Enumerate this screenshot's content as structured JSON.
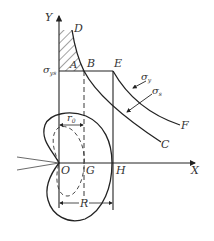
{
  "diagram": {
    "type": "stress-distribution-plastic-zone",
    "axes": {
      "x_label": "X",
      "y_label": "Y",
      "origin_label": "O"
    },
    "points": {
      "D": "D",
      "A": "A",
      "B": "B",
      "E": "E",
      "F": "F",
      "C": "C",
      "G": "G",
      "H": "H"
    },
    "stress_labels": {
      "yield_main": "σ",
      "yield_sub": "ys",
      "sigma_y_main": "σ",
      "sigma_y_sub": "y",
      "sigma_s_main": "σ",
      "sigma_s_sub": "s"
    },
    "dimensions": {
      "r0_main": "r",
      "r0_sub": "0",
      "R": "R"
    },
    "colors": {
      "line": "#222222",
      "hatch": "#333333",
      "text": "#333333"
    }
  }
}
